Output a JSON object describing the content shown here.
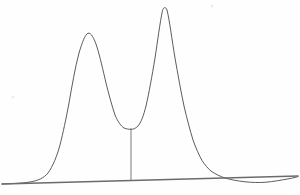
{
  "chart_data": {
    "type": "line",
    "title": "",
    "subtitle": "",
    "xlabel": "",
    "ylabel": "",
    "grid": false,
    "legend": "none",
    "axis_visible": "baseline-only",
    "xlim": [
      0,
      300
    ],
    "ylim": [
      0,
      195
    ],
    "background_color": "#fefefe",
    "trace_color": "#4a4a4a",
    "baseline_color": "#6b6b6b",
    "dropline_color": "#7a7a7a",
    "baseline": {
      "x_start": 2,
      "y_start": 184,
      "x_end": 298,
      "y_end": 176
    },
    "dropline": {
      "x": 131,
      "y_top": 128,
      "y_bottom": 181
    },
    "annotations": [
      {
        "name": "speck-upper-right",
        "x": 212,
        "y": 6,
        "r": 1.6
      },
      {
        "name": "speck-mid-left",
        "x": 13,
        "y": 97,
        "r": 1.6
      }
    ],
    "series": [
      {
        "name": "detector-signal",
        "peaks": [
          {
            "label": "peak-1",
            "apex_x": 85,
            "apex_y": 33,
            "height": 150,
            "width_base": 95
          },
          {
            "label": "peak-2",
            "apex_x": 162,
            "apex_y": 7,
            "height": 175,
            "width_base": 80
          }
        ],
        "valley": {
          "x": 131,
          "y": 128
        },
        "path": "M 2,184 C 14,183.6 22,183.2 30,182 C 38,180.6 44,178 48,173 C 53,166 57,156 60,145 C 63,133 66,119 69,103 C 72,86 75,68 79,53 C 82,43 85,34.5 88,33.2 C 91,32.5 94,38 97,47 C 100,57 103,70 106,83 C 109,95 112,106 115,115 C 118,122 121,126 124,128 C 126.5,129 129,129.4 131,129.4 C 133,129.4 135.5,128.6 138,126 C 141,122.5 143.5,116 146,106 C 149,93 152,76 155,58 C 157.5,42 160,22 162.5,10.5 C 164,6.5 165.5,6.8 167,10 C 169.5,20 172,40 175,58 C 178,75 181,92 184,106 C 187,119 190,130 193,140 C 196,148.5 199,155 202,160.5 C 205,165 208,168.5 211,171 C 215,174 220,176.3 225,178 C 231,179.8 238,181 245,181.8 C 252,182.5 259,182.8 266,182.2 C 273,181.6 281,180.2 290,178.5 C 294,177.7 297,177 298,176.6"
      }
    ]
  }
}
